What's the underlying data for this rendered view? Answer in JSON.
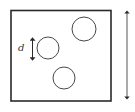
{
  "diagram": {
    "labels": {
      "diameter_label": "d"
    },
    "container": {
      "x": 11,
      "y": 10,
      "width": 100,
      "height": 91,
      "stroke": "#2a2a2a"
    },
    "circles": [
      {
        "name": "circle-top-right",
        "cx": 84,
        "cy": 29,
        "r": 12
      },
      {
        "name": "circle-middle-left",
        "cx": 48,
        "cy": 48,
        "r": 11
      },
      {
        "name": "circle-bottom",
        "cx": 64,
        "cy": 78,
        "r": 11
      }
    ],
    "arrows": [
      {
        "name": "height-arrow",
        "x": 127,
        "y1": 10,
        "y2": 100
      },
      {
        "name": "diameter-arrow",
        "x": 32,
        "y1": 37,
        "y2": 61
      }
    ],
    "colors": {
      "stroke": "#2a2a2a",
      "background": "#ffffff"
    }
  }
}
